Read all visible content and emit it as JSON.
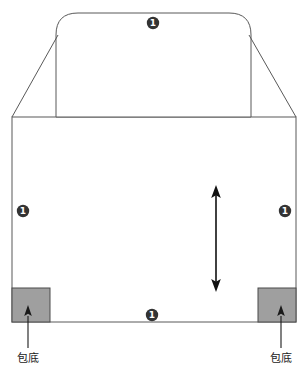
{
  "diagram": {
    "type": "bag-construction-drawing",
    "background_color": "#ffffff",
    "outline_color": "#595959",
    "gusset_fill_color": "#9f9f9f",
    "gusset_stroke_color": "#4a4a4a",
    "badge_fill_color": "#333333",
    "badge_text_color": "#ffffff",
    "arrow_color": "#111111",
    "callout_text_color": "#1a1a1a",
    "badges": [
      {
        "id": "badge-top",
        "label": "1",
        "x": 153,
        "y": 23
      },
      {
        "id": "badge-left",
        "label": "1",
        "x": 23,
        "y": 211
      },
      {
        "id": "badge-right",
        "label": "1",
        "x": 285,
        "y": 211
      },
      {
        "id": "badge-bottom",
        "label": "1",
        "x": 152,
        "y": 315
      }
    ],
    "callouts": [
      {
        "id": "callout-left",
        "label": "包底",
        "x": 28,
        "y": 362
      },
      {
        "id": "callout-right",
        "label": "包底",
        "x": 281,
        "y": 362
      }
    ],
    "gussets": [
      {
        "id": "gusset-left",
        "x": 12,
        "y": 288,
        "width": 38,
        "height": 34
      },
      {
        "id": "gusset-right",
        "x": 258,
        "y": 288,
        "width": 38,
        "height": 34
      }
    ],
    "height_arrow": {
      "id": "height-arrow",
      "x": 216,
      "y_top": 187,
      "y_bottom": 290,
      "double_headed": true
    },
    "body_panel": {
      "left": 12,
      "top": 117,
      "right": 296,
      "bottom": 322
    },
    "flap_panel": {
      "left": 56,
      "right": 251,
      "top": 13,
      "corner_radius": 22
    }
  }
}
